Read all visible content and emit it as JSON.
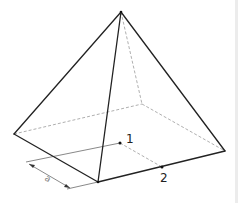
{
  "diagram": {
    "vertices": {
      "apex": [
        121,
        12
      ],
      "left": [
        14,
        134
      ],
      "front": [
        98,
        182
      ],
      "right": [
        225,
        151
      ],
      "back": [
        142,
        104
      ]
    },
    "points": [
      {
        "id": "1",
        "label": "1",
        "pos": [
          120,
          143
        ],
        "label_pos": [
          126,
          142
        ]
      },
      {
        "id": "2",
        "label": "2",
        "pos": [
          162,
          167
        ],
        "label_pos": [
          160,
          181
        ]
      }
    ],
    "dimension": {
      "label": "a",
      "from": [
        29,
        164
      ],
      "to": [
        70,
        188
      ]
    },
    "colors": {
      "edge": "#222222",
      "hidden": "#9a9a9a",
      "background": "#ffffff"
    }
  }
}
